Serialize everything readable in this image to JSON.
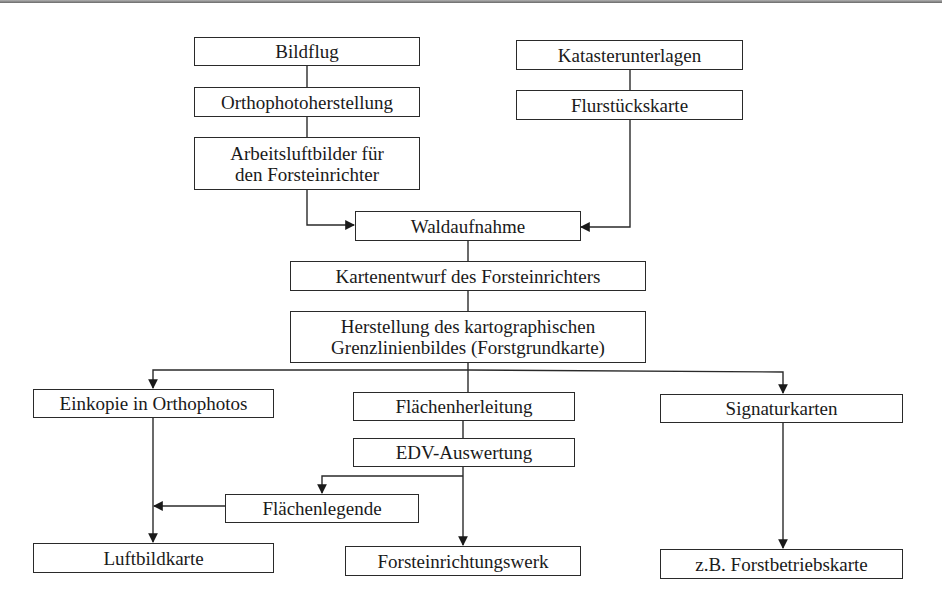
{
  "diagram": {
    "type": "flowchart",
    "language": "de",
    "nodes": [
      {
        "id": "bildflug",
        "label": "Bildflug"
      },
      {
        "id": "orthophoto",
        "label": "Orthophotoherstellung"
      },
      {
        "id": "arbeitsluftbilder",
        "label": "Arbeitsluftbilder für\nden Forsteinrichter"
      },
      {
        "id": "kataster",
        "label": "Katasterunterlagen"
      },
      {
        "id": "flurstueck",
        "label": "Flurstückskarte"
      },
      {
        "id": "waldaufnahme",
        "label": "Waldaufnahme"
      },
      {
        "id": "kartenentwurf",
        "label": "Kartenentwurf des Forsteinrichters"
      },
      {
        "id": "herstellung",
        "label": "Herstellung des kartographischen\nGrenzlinienbildes (Forstgrundkarte)"
      },
      {
        "id": "einkopie",
        "label": "Einkopie in Orthophotos"
      },
      {
        "id": "flaechenherleitung",
        "label": "Flächenherleitung"
      },
      {
        "id": "signaturkarten",
        "label": "Signaturkarten"
      },
      {
        "id": "edv",
        "label": "EDV-Auswertung"
      },
      {
        "id": "flaechenlegende",
        "label": "Flächenlegende"
      },
      {
        "id": "luftbildkarte",
        "label": "Luftbildkarte"
      },
      {
        "id": "forsteinrichtungswerk",
        "label": "Forsteinrichtungswerk"
      },
      {
        "id": "forstbetriebskarte",
        "label": "z.B. Forstbetriebskarte"
      }
    ],
    "edges": [
      {
        "from": "bildflug",
        "to": "orthophoto"
      },
      {
        "from": "orthophoto",
        "to": "arbeitsluftbilder"
      },
      {
        "from": "arbeitsluftbilder",
        "to": "waldaufnahme"
      },
      {
        "from": "kataster",
        "to": "flurstueck"
      },
      {
        "from": "flurstueck",
        "to": "waldaufnahme"
      },
      {
        "from": "waldaufnahme",
        "to": "kartenentwurf"
      },
      {
        "from": "kartenentwurf",
        "to": "herstellung"
      },
      {
        "from": "herstellung",
        "to": "einkopie"
      },
      {
        "from": "herstellung",
        "to": "flaechenherleitung"
      },
      {
        "from": "herstellung",
        "to": "signaturkarten"
      },
      {
        "from": "flaechenherleitung",
        "to": "edv"
      },
      {
        "from": "edv",
        "to": "flaechenlegende"
      },
      {
        "from": "edv",
        "to": "forsteinrichtungswerk"
      },
      {
        "from": "einkopie",
        "to": "luftbildkarte"
      },
      {
        "from": "flaechenlegende",
        "to": "luftbildkarte"
      },
      {
        "from": "signaturkarten",
        "to": "forstbetriebskarte"
      }
    ]
  }
}
